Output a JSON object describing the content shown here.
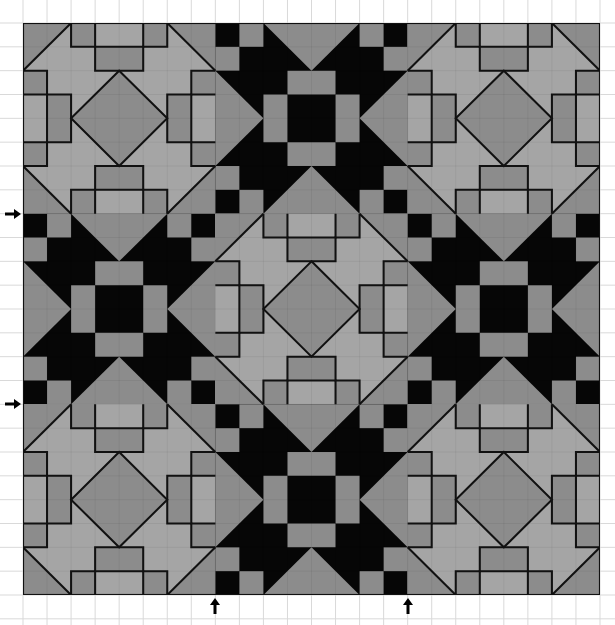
{
  "figure": {
    "grid_cells": 24,
    "block_size_cells": 8,
    "block_layout": [
      [
        "light",
        "star",
        "light"
      ],
      [
        "star",
        "light",
        "star"
      ],
      [
        "light",
        "star",
        "light"
      ]
    ],
    "colors": {
      "paper": "#ffffff",
      "grid_line": "#d9d9d9",
      "black": "#060606",
      "dark_gray": "#8c8c8c",
      "light_gray": "#a5a5a5",
      "outline": "#111111"
    },
    "arrows": [
      {
        "name": "left-arrow-row-8",
        "direction": "right",
        "side": "left",
        "grid_line": 8
      },
      {
        "name": "left-arrow-row-16",
        "direction": "right",
        "side": "left",
        "grid_line": 16
      },
      {
        "name": "bottom-arrow-col-8",
        "direction": "up",
        "side": "bottom",
        "grid_line": 8
      },
      {
        "name": "bottom-arrow-col-16",
        "direction": "up",
        "side": "bottom",
        "grid_line": 16
      }
    ]
  }
}
